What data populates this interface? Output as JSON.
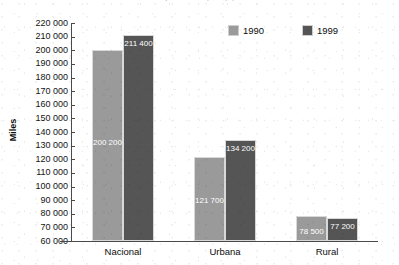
{
  "chart_data": {
    "type": "bar",
    "title": "(cut off at top edge)",
    "xlabel": "",
    "ylabel": "Miles",
    "categories": [
      "Nacional",
      "Urbana",
      "Rural"
    ],
    "series": [
      {
        "name": "1990",
        "color": "#9a9a9a",
        "values": [
          200200,
          121700,
          78500
        ],
        "labels": [
          "200 200",
          "121 700",
          "78 500"
        ]
      },
      {
        "name": "1999",
        "color": "#555555",
        "values": [
          211400,
          134200,
          77200
        ],
        "labels": [
          "211 400",
          "134 200",
          "77 200"
        ]
      }
    ],
    "ylim": [
      60000,
      220000
    ],
    "ytick_step": 10000,
    "ytick_labels": [
      "220 000",
      "210 000",
      "200 000",
      "190 000",
      "180 000",
      "170 000",
      "160 000",
      "150 000",
      "140 000",
      "130 000",
      "120 000",
      "110 000",
      "100 000",
      "90 000",
      "80 000",
      "70 000",
      "60 000"
    ],
    "ytick_values": [
      220000,
      210000,
      200000,
      190000,
      180000,
      170000,
      160000,
      150000,
      140000,
      130000,
      120000,
      110000,
      100000,
      90000,
      80000,
      70000,
      60000
    ],
    "grid": false,
    "legend_position": "top-right",
    "legend_entries": [
      "1990",
      "1999"
    ]
  }
}
